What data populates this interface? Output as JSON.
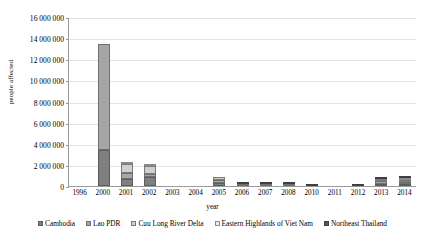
{
  "chart_data": {
    "type": "bar",
    "stacked": true,
    "title": "",
    "xlabel": "year",
    "ylabel": "people affected",
    "ylim": [
      0,
      16000000
    ],
    "ytick_step": 2000000,
    "ytick_labels": [
      "0",
      "2 000 000",
      "4 000 000",
      "6 000 000",
      "8 000 000",
      "10 000 000",
      "12 000 000",
      "14 000 000",
      "16 000 000"
    ],
    "ytick_values": [
      0,
      2000000,
      4000000,
      6000000,
      8000000,
      10000000,
      12000000,
      14000000,
      16000000
    ],
    "grid": true,
    "legend_position": "bottom",
    "categories": [
      "1996",
      "2000",
      "2001",
      "2002",
      "2003",
      "2004",
      "2005",
      "2006",
      "2007",
      "2008",
      "2010",
      "2011",
      "2012",
      "2013",
      "2014"
    ],
    "series": [
      {
        "name": "Cambodia",
        "color": "#7f7f7f",
        "values": [
          0,
          3400000,
          700000,
          900000,
          0,
          0,
          250000,
          0,
          0,
          0,
          0,
          0,
          0,
          200000,
          200000
        ]
      },
      {
        "name": "Lao PDR",
        "color": "#a6a6a6",
        "values": [
          0,
          10000000,
          500000,
          250000,
          0,
          0,
          300000,
          100000,
          150000,
          100000,
          0,
          0,
          0,
          250000,
          200000
        ]
      },
      {
        "name": "Cuu Long River Delta",
        "color": "#d0d0d0",
        "values": [
          0,
          0,
          900000,
          750000,
          0,
          0,
          350000,
          0,
          0,
          0,
          0,
          0,
          0,
          100000,
          200000
        ]
      },
      {
        "name": "Eastern Highlands of Viet Nam",
        "color": "#ececec",
        "values": [
          0,
          0,
          100000,
          150000,
          0,
          0,
          0,
          0,
          0,
          0,
          0,
          0,
          0,
          0,
          100000
        ]
      },
      {
        "name": "Northeast Thailand",
        "color": "#595959",
        "values": [
          0,
          0,
          0,
          0,
          0,
          0,
          0,
          100000,
          200000,
          50000,
          200000,
          0,
          80000,
          100000,
          150000
        ]
      }
    ]
  }
}
